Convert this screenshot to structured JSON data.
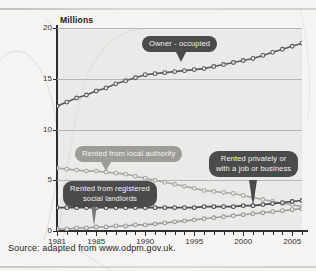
{
  "page": {
    "source_note": "Source: adapted from www.odpm.gov.uk."
  },
  "chart_data": {
    "type": "line",
    "title": "",
    "axis_unit_label": "Millions",
    "xlabel": "",
    "ylabel": "Millions",
    "ylim": [
      0,
      20
    ],
    "xlim": [
      1981,
      2006
    ],
    "yticks": [
      0,
      5,
      10,
      15,
      20
    ],
    "xticks": [
      1981,
      1985,
      1990,
      1995,
      2000,
      2005
    ],
    "grid": "horizontal",
    "legend_position": "annotations-on-plot",
    "marker": "open-circle",
    "x": [
      1981,
      1982,
      1983,
      1984,
      1985,
      1986,
      1987,
      1988,
      1989,
      1990,
      1991,
      1992,
      1993,
      1994,
      1995,
      1996,
      1997,
      1998,
      1999,
      2000,
      2001,
      2002,
      2003,
      2004,
      2005,
      2006
    ],
    "series": [
      {
        "name": "Owner - occupied",
        "color": "#5a5a5a",
        "values": [
          12.3,
          12.7,
          13.1,
          13.4,
          13.8,
          14.1,
          14.5,
          14.8,
          15.1,
          15.4,
          15.5,
          15.6,
          15.7,
          15.8,
          15.9,
          16.0,
          16.2,
          16.4,
          16.6,
          16.8,
          17.0,
          17.3,
          17.6,
          17.9,
          18.2,
          18.5
        ]
      },
      {
        "name": "Rented from local authority",
        "color": "#a9a8a5",
        "values": [
          6.2,
          6.1,
          6.0,
          5.9,
          5.9,
          5.8,
          5.7,
          5.6,
          5.4,
          5.2,
          5.0,
          4.8,
          4.6,
          4.4,
          4.2,
          4.0,
          3.9,
          3.8,
          3.7,
          3.5,
          3.3,
          3.1,
          2.9,
          2.7,
          2.6,
          2.4
        ]
      },
      {
        "name": "Rented privately or with a job or business",
        "color": "#4a4a4a",
        "values": [
          2.3,
          2.3,
          2.3,
          2.3,
          2.3,
          2.3,
          2.3,
          2.3,
          2.3,
          2.3,
          2.3,
          2.3,
          2.3,
          2.3,
          2.3,
          2.4,
          2.4,
          2.4,
          2.4,
          2.5,
          2.5,
          2.6,
          2.7,
          2.8,
          2.9,
          3.0
        ]
      },
      {
        "name": "Rented from registered social landlords",
        "color": "#9b9a97",
        "values": [
          0.2,
          0.2,
          0.3,
          0.3,
          0.4,
          0.4,
          0.5,
          0.5,
          0.6,
          0.6,
          0.7,
          0.8,
          0.9,
          1.0,
          1.1,
          1.2,
          1.3,
          1.4,
          1.5,
          1.6,
          1.7,
          1.8,
          1.9,
          2.0,
          2.1,
          2.2
        ]
      }
    ],
    "annotations": [
      {
        "id": "owner-occupied",
        "text": "Owner - occupied",
        "style": "dark"
      },
      {
        "id": "local-authority",
        "text": "Rented from local authority",
        "style": "light"
      },
      {
        "id": "private-or-job",
        "text": "Rented privately or\nwith a job or business",
        "style": "dark"
      },
      {
        "id": "social-landlords",
        "text": "Rented from registered\nsocial landlords",
        "style": "dark"
      }
    ]
  }
}
